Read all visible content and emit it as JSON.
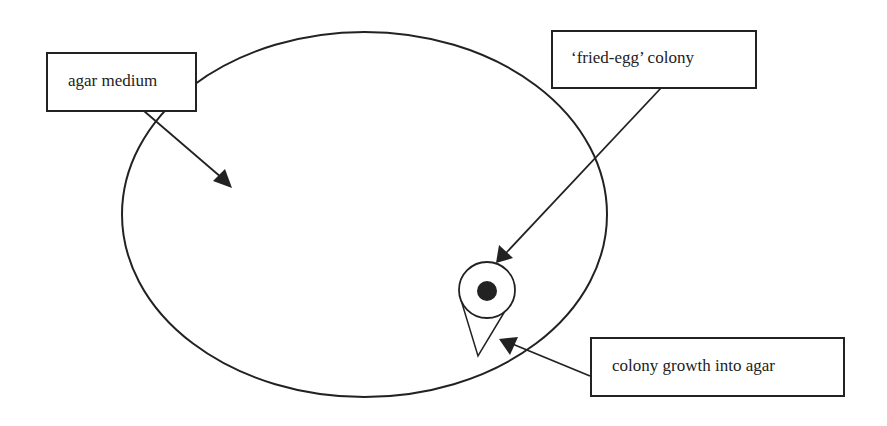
{
  "diagram": {
    "labels": {
      "agar": "agar medium",
      "fried_egg": "‘fried-egg’ colony",
      "growth": "colony growth into agar"
    },
    "colors": {
      "stroke": "#222222",
      "fill": "#ffffff"
    }
  }
}
